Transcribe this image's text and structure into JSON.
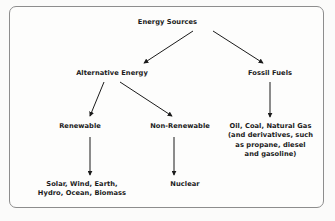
{
  "diagram": {
    "border_color": "#8d8d8d",
    "text_color": "#1b1b1b",
    "line_color": "#1b1b1b",
    "background": "#fdfdfc",
    "nodes": {
      "root": "Energy Sources",
      "alternative": "Alternative Energy",
      "fossil": "Fossil Fuels",
      "renewable": "Renewable",
      "non_renewable": "Non-Renewable",
      "nuclear": "Nuclear",
      "fossil_detail": {
        "line1": "Oil, Coal, Natural Gas",
        "line2": "(and derivatives, such",
        "line3": "as propane, diesel",
        "line4": "and gasoline)"
      },
      "renewable_detail": {
        "line1": "Solar, Wind, Earth,",
        "line2": "Hydro, Ocean, Biomass"
      }
    },
    "edges": [
      {
        "from": "Energy Sources",
        "to": "Alternative Energy",
        "style": "solid-arrow"
      },
      {
        "from": "Energy Sources",
        "to": "Fossil Fuels",
        "style": "solid-arrow"
      },
      {
        "from": "Alternative Energy",
        "to": "Renewable",
        "style": "solid-arrow"
      },
      {
        "from": "Alternative Energy",
        "to": "Non-Renewable",
        "style": "solid-arrow"
      },
      {
        "from": "Fossil Fuels",
        "to": "Oil, Coal, Natural Gas",
        "style": "solid-arrow"
      },
      {
        "from": "Renewable",
        "to": "Solar, Wind, Earth, Hydro, Ocean, Biomass",
        "style": "solid-arrow"
      },
      {
        "from": "Non-Renewable",
        "to": "Nuclear",
        "style": "solid-arrow"
      }
    ]
  }
}
